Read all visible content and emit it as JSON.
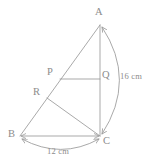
{
  "figure": {
    "kind": "geometry-diagram",
    "stroke_color": "#9a9a9a",
    "label_color": "#8c8c8c",
    "background_color": "#ffffff",
    "vertices": [
      {
        "id": "A",
        "label": "A",
        "x": 100,
        "y": 25
      },
      {
        "id": "P",
        "label": "P",
        "x": 60,
        "y": 79
      },
      {
        "id": "Q",
        "label": "Q",
        "x": 100,
        "y": 79
      },
      {
        "id": "R",
        "label": "R",
        "x": 47,
        "y": 98
      },
      {
        "id": "B",
        "label": "B",
        "x": 20,
        "y": 136
      },
      {
        "id": "C",
        "label": "C",
        "x": 100,
        "y": 136
      }
    ],
    "segments": [
      {
        "id": "AC",
        "from": "A",
        "to": "C"
      },
      {
        "id": "AB",
        "from": "A",
        "to": "B"
      },
      {
        "id": "BC",
        "from": "B",
        "to": "C"
      },
      {
        "id": "PQ",
        "from": "P",
        "to": "Q"
      },
      {
        "id": "RC",
        "from": "R",
        "to": "C"
      }
    ],
    "dimensions": [
      {
        "id": "dim-AC",
        "label": "16 cm",
        "measures": "AC",
        "arrow": "double",
        "side": "right"
      },
      {
        "id": "dim-BC",
        "label": "12 cm",
        "measures": "BC",
        "arrow": "double",
        "side": "bottom"
      }
    ]
  }
}
